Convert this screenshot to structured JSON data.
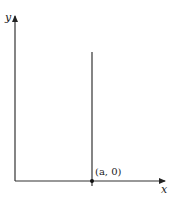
{
  "diagram": {
    "axes": {
      "x_label": "x",
      "y_label": "y"
    },
    "vertical_line": {
      "description": "vertical line x = a"
    },
    "point": {
      "label": "(a, 0)"
    },
    "colors": {
      "stroke": "#333333",
      "background": "#ffffff"
    }
  }
}
